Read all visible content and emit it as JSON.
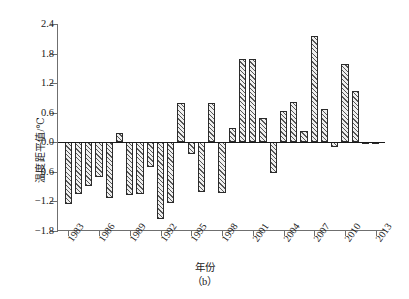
{
  "figure": {
    "panel_caption": "（b）",
    "x_axis_title": "年份",
    "y_axis_title": "温度距平值/℃"
  },
  "chart_data": {
    "type": "bar",
    "title": "",
    "subtitle": "",
    "xlabel": "年份",
    "ylabel": "温度距平值/℃",
    "ylim": [
      -1.8,
      2.4
    ],
    "ytick_labels": [
      "2.4",
      "1.8",
      "1.2",
      "0.6",
      "0.0",
      "-0.6",
      "-1.2",
      "-1.8"
    ],
    "ytick_values": [
      2.4,
      1.8,
      1.2,
      0.6,
      0.0,
      -0.6,
      -1.2,
      -1.8
    ],
    "xtick_labels": [
      "1983",
      "1986",
      "1989",
      "1992",
      "1995",
      "1998",
      "2001",
      "2004",
      "2007",
      "2010",
      "2013"
    ],
    "xtick_values": [
      1983,
      1986,
      1989,
      1992,
      1995,
      1998,
      2001,
      2004,
      2007,
      2010,
      2013
    ],
    "xlim": [
      1982,
      2014
    ],
    "grid": false,
    "legend": null,
    "annotations": [],
    "categories": [
      1983,
      1984,
      1985,
      1986,
      1987,
      1988,
      1989,
      1990,
      1991,
      1992,
      1993,
      1994,
      1995,
      1996,
      1997,
      1998,
      1999,
      2000,
      2001,
      2002,
      2003,
      2004,
      2005,
      2006,
      2007,
      2008,
      2009,
      2010,
      2011,
      2012,
      2013
    ],
    "values": [
      -1.26,
      -1.05,
      -0.88,
      -0.7,
      -1.14,
      0.18,
      -1.07,
      -1.05,
      -0.5,
      -1.56,
      -1.23,
      0.8,
      -0.23,
      -1.0,
      0.8,
      -1.02,
      0.3,
      1.68,
      1.68,
      0.5,
      -0.63,
      0.63,
      0.82,
      0.22,
      2.15,
      0.68,
      -0.1,
      1.59,
      1.04,
      0.0,
      -0.02
    ],
    "series": [
      {
        "name": "温度距平值",
        "values": [
          -1.26,
          -1.05,
          -0.88,
          -0.7,
          -1.14,
          0.18,
          -1.07,
          -1.05,
          -0.5,
          -1.56,
          -1.23,
          0.8,
          -0.23,
          -1.0,
          0.8,
          -1.02,
          0.3,
          1.68,
          1.68,
          0.5,
          -0.63,
          0.63,
          0.82,
          0.22,
          2.15,
          0.68,
          -0.1,
          1.59,
          1.04,
          0.0,
          -0.02
        ]
      }
    ],
    "bar_style": {
      "fill": "#efefef",
      "hatch": "///",
      "edge_color": "#2b2b2b"
    },
    "axis_color": "#6f6f6f",
    "zero_line_color": "#1a1a1a"
  }
}
